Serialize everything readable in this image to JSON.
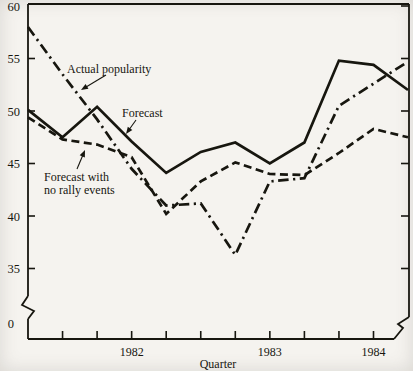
{
  "figure": {
    "bg_color": "#f5f3ef",
    "ink_color": "#17160f"
  },
  "chart_data": {
    "type": "line",
    "title": "",
    "xlabel": "Quarter",
    "ylabel": "",
    "ylim_shown": [
      35,
      60
    ],
    "grid": false,
    "y_ticks": [
      60,
      55,
      50,
      45,
      40,
      35
    ],
    "origin_label": "0",
    "y_axis_break": true,
    "x_axis_break": true,
    "x": [
      0,
      1,
      2,
      3,
      4,
      5,
      6,
      7,
      8,
      9,
      10,
      11
    ],
    "year_labels": [
      {
        "label": "1982",
        "point_index": 3
      },
      {
        "label": "1983",
        "point_index": 7
      },
      {
        "label": "1984",
        "point_index": 10
      }
    ],
    "series": [
      {
        "name": "Actual popularity",
        "style": "dashdot",
        "values": [
          58.0,
          53.5,
          49.2,
          44.5,
          41.0,
          41.2,
          36.3,
          43.3,
          43.6,
          50.5,
          52.6,
          54.7
        ]
      },
      {
        "name": "Forecast",
        "style": "solid",
        "values": [
          50.1,
          47.5,
          50.4,
          47.1,
          44.1,
          46.1,
          47.0,
          45.0,
          47.0,
          54.8,
          54.4,
          52.0
        ]
      },
      {
        "name": "Forecast with no rally events",
        "style": "dashed",
        "values": [
          49.4,
          47.3,
          46.8,
          45.6,
          40.2,
          43.3,
          45.1,
          44.0,
          43.9,
          46.0,
          48.3,
          47.5
        ]
      }
    ],
    "annotations": [
      {
        "lines": [
          "Actual popularity"
        ],
        "x": 67,
        "y": 73,
        "arrow": {
          "x1": 106,
          "y1": 75,
          "x2": 81,
          "y2": 90
        }
      },
      {
        "lines": [
          "Forecast"
        ],
        "x": 122,
        "y": 117,
        "arrow": {
          "x1": 136,
          "y1": 120,
          "x2": 126,
          "y2": 134
        }
      },
      {
        "lines": [
          "Forecast with",
          "no rally events"
        ],
        "x": 44,
        "y": 181,
        "line_height": 13,
        "arrow": {
          "x1": 77,
          "y1": 169,
          "x2": 85,
          "y2": 150
        }
      }
    ],
    "legend_position": "none"
  }
}
